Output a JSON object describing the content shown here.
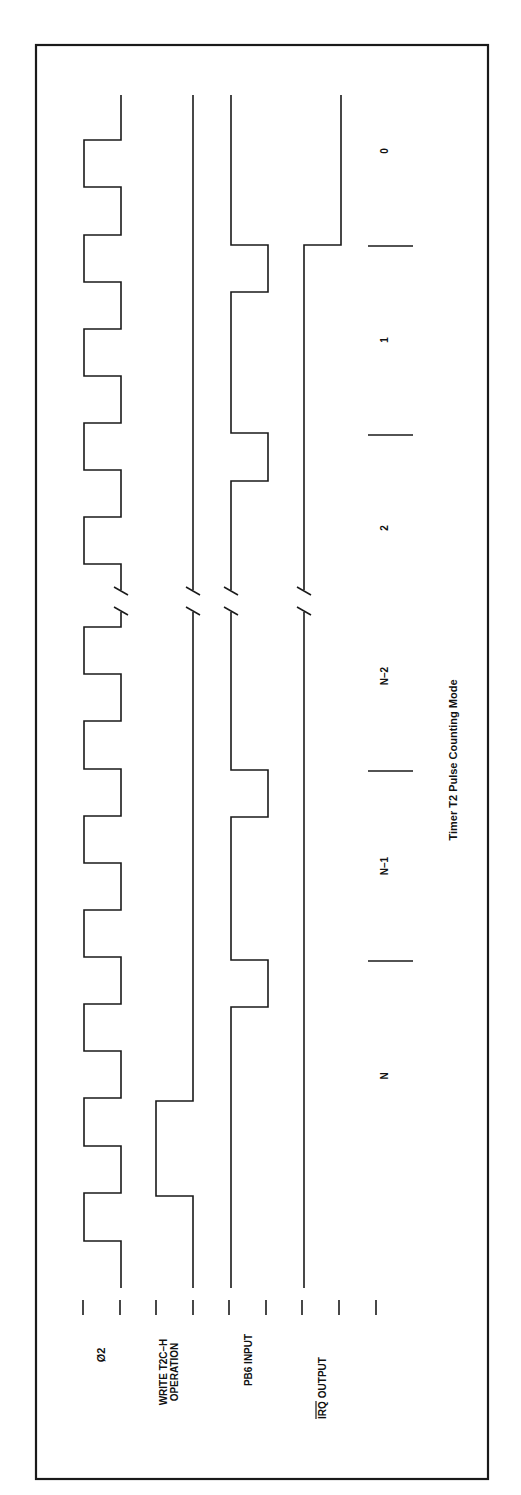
{
  "diagram": {
    "title": "Timer T2 Pulse Counting Mode",
    "orientation": "rotated-90-ccw",
    "colors": {
      "ink": "#1a1a1a",
      "background": "#ffffff"
    },
    "signals": [
      {
        "id": "phi2",
        "label": "Ø2",
        "label_line2": ""
      },
      {
        "id": "write",
        "label": "WRITE T2C–H",
        "label_line2": "OPERATION"
      },
      {
        "id": "pb6",
        "label": "PB6 INPUT",
        "label_line2": ""
      },
      {
        "id": "irq",
        "label": "IRQ",
        "label_overbar": true,
        "label_suffix": " OUTPUT"
      }
    ],
    "counts": [
      "N",
      "N–1",
      "N–2",
      "2",
      "1",
      "0"
    ],
    "break_marker": "//"
  }
}
